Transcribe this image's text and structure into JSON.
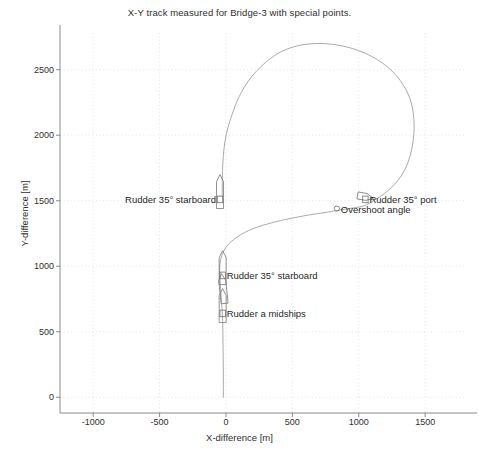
{
  "chart_data": {
    "type": "line",
    "title": "X-Y track measured for Bridge-3 with special points.",
    "xlabel": "X-difference [m]",
    "ylabel": "Y-difference [m]",
    "xlim": [
      -1250,
      1800
    ],
    "ylim": [
      -120,
      2780
    ],
    "xticks": [
      -1000,
      -500,
      0,
      500,
      1000,
      1500
    ],
    "xtick_labels": [
      "-1000",
      "-500",
      "0",
      "500",
      "1000",
      "1500"
    ],
    "yticks": [
      0,
      500,
      1000,
      1500,
      2000,
      2500
    ],
    "ytick_labels": [
      "0",
      "500",
      "1000",
      "1500",
      "2000",
      "2500"
    ],
    "grid": true,
    "legend": null,
    "series": [
      {
        "name": "X-Y track",
        "x": [
          -20,
          -20,
          -20,
          -21,
          -22,
          -23,
          -24,
          -25,
          -27,
          -30,
          -34,
          -38,
          -42,
          -45,
          -47,
          -48,
          -46,
          -40,
          -28,
          -10,
          20,
          60,
          110,
          170,
          240,
          320,
          410,
          500,
          590,
          680,
          760,
          830,
          890,
          940,
          985,
          1020,
          1060,
          1110,
          1180,
          1250,
          1320,
          1370,
          1400,
          1415,
          1415,
          1400,
          1365,
          1310,
          1240,
          1150,
          1050,
          940,
          830,
          720,
          610,
          510,
          420,
          340,
          270,
          200,
          140,
          90,
          50,
          15,
          -8,
          -20,
          -26,
          -28,
          -28
        ],
        "y": [
          0,
          100,
          200,
          300,
          400,
          470,
          530,
          580,
          630,
          680,
          730,
          790,
          850,
          900,
          940,
          975,
          1010,
          1050,
          1090,
          1130,
          1170,
          1205,
          1240,
          1272,
          1300,
          1325,
          1348,
          1368,
          1385,
          1400,
          1412,
          1424,
          1434,
          1442,
          1449,
          1455,
          1470,
          1500,
          1545,
          1605,
          1690,
          1790,
          1900,
          2010,
          2120,
          2230,
          2330,
          2420,
          2500,
          2570,
          2625,
          2665,
          2690,
          2700,
          2695,
          2675,
          2640,
          2590,
          2530,
          2455,
          2370,
          2275,
          2170,
          2060,
          1950,
          1840,
          1730,
          1620,
          1540
        ]
      }
    ],
    "special_points": [
      {
        "label": "Rudder a midships",
        "x": -25,
        "y": 640,
        "marker": "ship-outline",
        "label_side": "right"
      },
      {
        "label": "Rudder 35° starboard",
        "x": -25,
        "y": 930,
        "marker": "ship-outline",
        "label_side": "right"
      },
      {
        "label": "Rudder 35° starboard",
        "x": -45,
        "y": 1510,
        "marker": "ship-outline",
        "label_side": "left"
      },
      {
        "label": "Overshoot angle",
        "x": 835,
        "y": 1440,
        "marker": "circle",
        "label_side": "right"
      },
      {
        "label": "Rudder 35° port",
        "x": 1050,
        "y": 1510,
        "marker": "ship-outline",
        "label_side": "right"
      }
    ]
  },
  "style": {
    "line_color": "#9a9a9a",
    "grid_color": "#d9d9d9",
    "axis_color": "#7d7d7d",
    "text_color": "#2e2e2e",
    "marker_color": "#6f6f6f",
    "background": "#ffffff"
  }
}
